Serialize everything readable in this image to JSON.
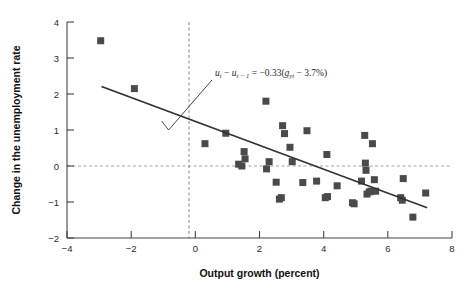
{
  "chart_data": {
    "type": "scatter",
    "title": "",
    "xlabel": "Output growth (percent)",
    "ylabel": "Change in the unemployment rate",
    "xlim": [
      -4,
      8
    ],
    "ylim": [
      -2,
      4
    ],
    "xticks": [
      -4,
      -2,
      0,
      2,
      4,
      6,
      8
    ],
    "xtick_labels": [
      "−4",
      "−2",
      "0",
      "2",
      "4",
      "6",
      "8"
    ],
    "yticks": [
      -2,
      -1,
      0,
      1,
      2,
      3,
      4
    ],
    "ytick_labels": [
      "−2",
      "−1",
      "0",
      "1",
      "2",
      "3",
      "4"
    ],
    "grid": false,
    "legend": "none",
    "marker": {
      "shape": "square",
      "size": 7,
      "color": "#4a4a4a"
    },
    "points": [
      [
        -2.95,
        3.48
      ],
      [
        -1.9,
        2.15
      ],
      [
        0.3,
        0.62
      ],
      [
        0.95,
        0.91
      ],
      [
        1.35,
        0.05
      ],
      [
        1.45,
        0.0
      ],
      [
        1.52,
        0.4
      ],
      [
        1.55,
        0.2
      ],
      [
        2.2,
        1.8
      ],
      [
        2.22,
        -0.08
      ],
      [
        2.3,
        0.12
      ],
      [
        2.52,
        -0.45
      ],
      [
        2.62,
        -0.92
      ],
      [
        2.68,
        -0.88
      ],
      [
        2.72,
        1.12
      ],
      [
        2.78,
        0.9
      ],
      [
        2.95,
        0.52
      ],
      [
        3.02,
        0.12
      ],
      [
        3.35,
        -0.46
      ],
      [
        3.48,
        0.98
      ],
      [
        3.78,
        -0.42
      ],
      [
        4.05,
        -0.88
      ],
      [
        4.12,
        -0.85
      ],
      [
        4.1,
        0.32
      ],
      [
        4.42,
        -0.55
      ],
      [
        4.9,
        -1.02
      ],
      [
        4.95,
        -1.05
      ],
      [
        5.18,
        -0.42
      ],
      [
        5.28,
        0.85
      ],
      [
        5.3,
        0.08
      ],
      [
        5.32,
        -0.12
      ],
      [
        5.35,
        -0.78
      ],
      [
        5.42,
        -0.72
      ],
      [
        5.48,
        -0.7
      ],
      [
        5.52,
        0.62
      ],
      [
        5.58,
        -0.38
      ],
      [
        5.62,
        -0.7
      ],
      [
        6.4,
        -0.88
      ],
      [
        6.45,
        -0.95
      ],
      [
        6.48,
        -0.35
      ],
      [
        6.78,
        -1.42
      ],
      [
        7.18,
        -0.75
      ]
    ],
    "fit_line": {
      "label": "regression line",
      "slope": -0.33,
      "x_intercept": 3.7,
      "x_start": -2.9,
      "y_start": 2.2,
      "x_end": 7.2,
      "y_end": -1.15,
      "color": "#333333"
    },
    "reference_lines": [
      {
        "name": "zero-change-line",
        "orientation": "horizontal",
        "value": 0,
        "style": "dashed",
        "color": "#999999"
      },
      {
        "name": "zero-growth-line",
        "orientation": "vertical",
        "value": 0,
        "style": "dashed",
        "color": "#888888"
      }
    ],
    "annotation": {
      "name": "okun-law-equation",
      "lhs_u": "u",
      "lhs_sub1": "t",
      "minus": " − ",
      "lhs_u2": "u",
      "lhs_sub2": "t − 1",
      "equals": " = ",
      "rhs": "−0.33(",
      "g_symbol": "g",
      "g_sub": "yt",
      "rhs_tail": " − 3.7%)",
      "full_text": "uₜ − uₜ₋₁ = −0.33(gᵧₜ − 3.7%)",
      "leader": {
        "tip_x": -1.05,
        "tip_y": 1.25
      }
    }
  }
}
